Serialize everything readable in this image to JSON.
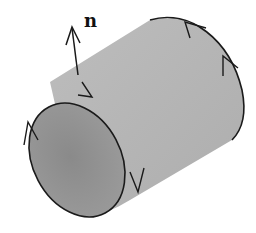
{
  "diagram": {
    "normal_label": "n",
    "colors": {
      "background": "#ffffff",
      "outer_surface": "#b4b4b4",
      "inner_face": "#8c8c8c",
      "stroke": "#1a1a1a"
    },
    "elements": [
      {
        "id": "normal-vector",
        "label": "n",
        "direction": "outward/up"
      },
      {
        "id": "front-boundary-circle",
        "orientation_arrows": 3
      },
      {
        "id": "back-boundary-circle",
        "orientation_arrows": 2
      }
    ]
  }
}
